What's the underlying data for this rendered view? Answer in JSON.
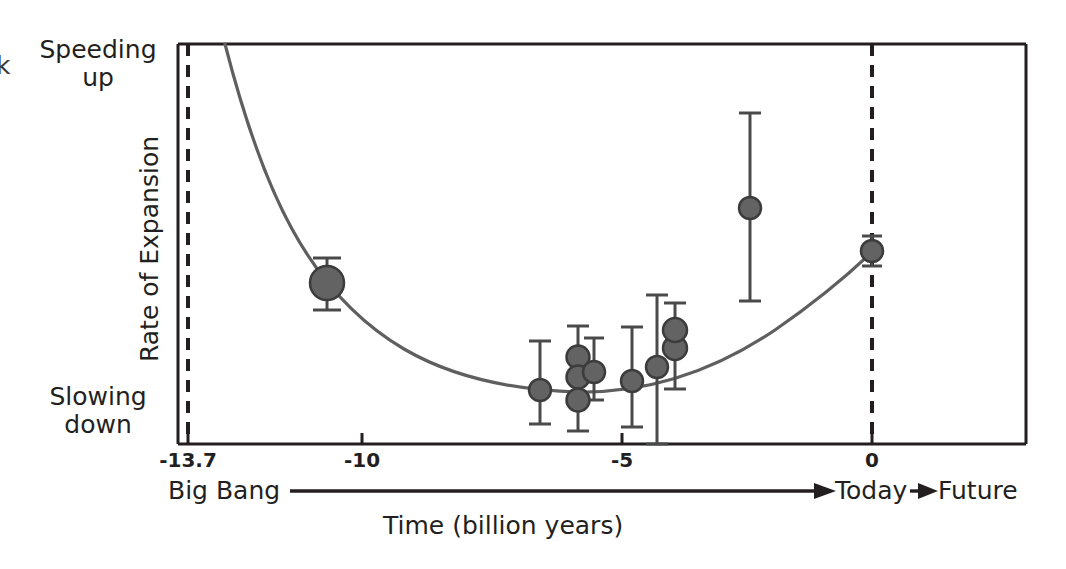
{
  "chart_data": {
    "type": "scatter",
    "title": "",
    "xlabel": "Time (billion years)",
    "ylabel": "Rate of Expansion",
    "xlim": [
      -13.7,
      1.0
    ],
    "ylim": [
      0,
      1
    ],
    "grid": false,
    "legend": "none",
    "x_ticks": [
      {
        "value": -13.7,
        "label": "-13.7"
      },
      {
        "value": -10,
        "label": "-10"
      },
      {
        "value": -5,
        "label": "-5"
      },
      {
        "value": 0,
        "label": "0"
      }
    ],
    "y_axis_end_labels": {
      "top": "Speeding\nup",
      "bottom": "Slowing\ndown"
    },
    "annotations": {
      "left_cut_glyph": "k",
      "timeline_start": "Big Bang",
      "timeline_today": "Today",
      "timeline_future": "Future"
    },
    "reference_lines": [
      {
        "name": "big-bang-line",
        "x": -13.7,
        "style": "dashed"
      },
      {
        "name": "today-line",
        "x": 0,
        "style": "dashed"
      }
    ],
    "fit_curve": {
      "name": "expansion-rate-model",
      "description": "Deceleration then acceleration; minimum near -6.5 billion years",
      "color": "#5f5f5f"
    },
    "series": [
      {
        "name": "supernova-measurements",
        "marker": "filled-circle",
        "color": "#5a5a5a",
        "points": [
          {
            "x": -10.6,
            "y": 0.565,
            "yerr_low": 0.535,
            "yerr_high": 0.605,
            "size": "large"
          },
          {
            "x": -6.4,
            "y": 0.157,
            "yerr_low": 0.02,
            "yerr_high": 0.285,
            "size": "small"
          },
          {
            "x": -5.9,
            "y": 0.225,
            "yerr_low": 0.035,
            "yerr_high": 0.34,
            "size": "small"
          },
          {
            "x": -5.9,
            "y": 0.178,
            "yerr_low": 0.035,
            "yerr_high": 0.34,
            "size": "small"
          },
          {
            "x": -5.9,
            "y": 0.122,
            "yerr_low": 0.02,
            "yerr_high": 0.34,
            "size": "small"
          },
          {
            "x": -5.6,
            "y": 0.188,
            "yerr_low": 0.08,
            "yerr_high": 0.3,
            "size": "small"
          },
          {
            "x": -4.5,
            "y": 0.16,
            "yerr_low": 0.01,
            "yerr_high": 0.295,
            "size": "small"
          },
          {
            "x": -4.2,
            "y": 0.203,
            "yerr_low": -0.01,
            "yerr_high": 0.39,
            "size": "small"
          },
          {
            "x": -3.8,
            "y": 0.25,
            "yerr_low": 0.09,
            "yerr_high": 0.4,
            "size": "small"
          },
          {
            "x": -2.4,
            "y": 0.59,
            "yerr_low": 0.36,
            "yerr_high": 0.82,
            "size": "small"
          },
          {
            "x": 0.0,
            "y": 0.485,
            "yerr_low": 0.448,
            "yerr_high": 0.522,
            "size": "small"
          }
        ]
      }
    ]
  }
}
